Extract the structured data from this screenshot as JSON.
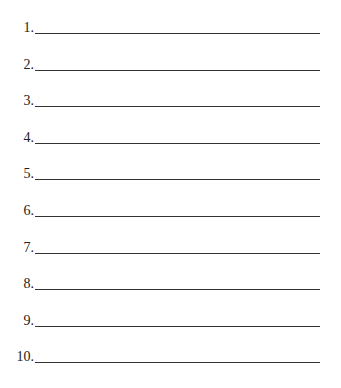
{
  "items": [
    {
      "label": "1.",
      "value": ""
    },
    {
      "label": "2.",
      "value": ""
    },
    {
      "label": "3.",
      "value": ""
    },
    {
      "label": "4.",
      "value": ""
    },
    {
      "label": "5.",
      "value": ""
    },
    {
      "label": "6.",
      "value": ""
    },
    {
      "label": "7.",
      "value": ""
    },
    {
      "label": "8.",
      "value": ""
    },
    {
      "label": "9.",
      "value": ""
    },
    {
      "label": "10.",
      "value": ""
    }
  ]
}
